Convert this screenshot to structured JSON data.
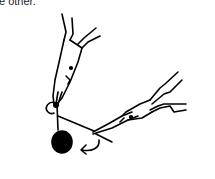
{
  "caption": {
    "text": "e other."
  },
  "illustration": {
    "description": "Two pairs of round-nose pliers: one holding a wire loop with a bead below, the other gripping the wire tail and wrapping it around the stem",
    "elements": [
      "pliers-holding-loop",
      "pliers-wrapping-wire",
      "wire-loop",
      "wire-tail",
      "bead",
      "wrap-direction-arrow"
    ],
    "stroke_color": "#000000",
    "background_color": "#ffffff"
  }
}
